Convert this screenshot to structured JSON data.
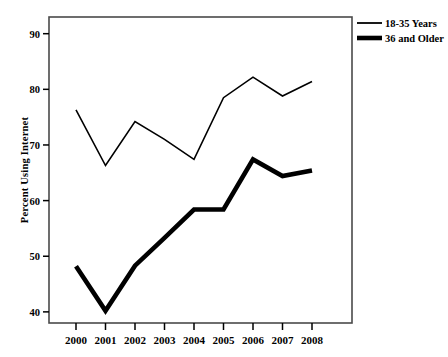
{
  "chart_data": {
    "type": "line",
    "title": "",
    "subtitle": "",
    "xlabel": "",
    "ylabel": "Percent Using Internet",
    "x": [
      2000,
      2001,
      2002,
      2003,
      2004,
      2005,
      2006,
      2007,
      2008
    ],
    "categories": [
      "2000",
      "2001",
      "2002",
      "2003",
      "2004",
      "2005",
      "2006",
      "2007",
      "2008"
    ],
    "xtick_labels": [
      "2000",
      "2001",
      "2002",
      "2003",
      "2004",
      "2005",
      "2006",
      "2007",
      "2008"
    ],
    "ytick_labels": [
      "40",
      "50",
      "60",
      "70",
      "80",
      "90"
    ],
    "yticks": [
      40,
      50,
      60,
      70,
      80,
      90
    ],
    "ylim": [
      38,
      93
    ],
    "xlim": [
      1999.5,
      2008.6
    ],
    "grid": false,
    "legend_position": "top-right-outside",
    "series": [
      {
        "name": "18-35 Years",
        "values": [
          76.3,
          66.3,
          74.2,
          71.0,
          67.4,
          78.5,
          82.2,
          78.8,
          81.4
        ],
        "color": "#000000",
        "line_width": 1.6,
        "style": "thin"
      },
      {
        "name": "36 and Older",
        "values": [
          48.2,
          40.2,
          48.3,
          53.3,
          58.4,
          58.4,
          67.4,
          64.4,
          65.4
        ],
        "color": "#000000",
        "line_width": 4.6,
        "style": "thick"
      }
    ]
  },
  "legend": {
    "items": [
      {
        "label": "18-35 Years",
        "swatch": "thin-line-swatch"
      },
      {
        "label": "36 and Older",
        "swatch": "thick-line-swatch"
      }
    ]
  },
  "axes": {
    "y_axis_title": "Percent Using Internet",
    "x_axis_title": ""
  },
  "colors": {
    "background": "#ffffff",
    "foreground": "#000000",
    "frame": "#3a3a3a"
  }
}
